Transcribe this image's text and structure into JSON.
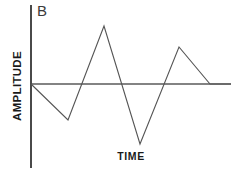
{
  "figure": {
    "panel_label": "B",
    "width_px": 231,
    "height_px": 172,
    "background_color": "#ffffff"
  },
  "axes": {
    "y_title": "AMPLITUDE",
    "x_title": "TIME",
    "y_axis_color": "#4a4a4a",
    "zero_line_color": "#838383",
    "trace_color": "#555555"
  },
  "chart_data": {
    "type": "line",
    "title": "B",
    "xlabel": "TIME",
    "ylabel": "AMPLITUDE",
    "grid": false,
    "legend": null,
    "axis_ticks": {
      "x": [],
      "y": []
    },
    "xlim": [
      0,
      200
    ],
    "ylim": [
      -60,
      58
    ],
    "zero_line": 0,
    "series": [
      {
        "name": "waveform-b",
        "x": [
          0,
          37,
          73,
          109,
          148,
          179,
          200
        ],
        "y": [
          0,
          -36,
          58,
          -60,
          37,
          0,
          0
        ]
      }
    ],
    "svg_points": [
      [
        31,
        84
      ],
      [
        68,
        120
      ],
      [
        104,
        26
      ],
      [
        140,
        144
      ],
      [
        179,
        47
      ],
      [
        210,
        84
      ],
      [
        231,
        84
      ]
    ],
    "zero_crossings_x": [
      31,
      85,
      118,
      161,
      210
    ],
    "annotations": [
      {
        "text": "B",
        "x": 38,
        "y": 13
      }
    ]
  }
}
